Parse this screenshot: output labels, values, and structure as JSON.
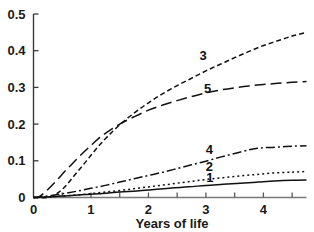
{
  "chart_data": {
    "type": "line",
    "title": "",
    "xlabel": "Years of life",
    "ylabel": "",
    "xlim": [
      0,
      4.75
    ],
    "ylim": [
      0,
      0.5
    ],
    "grid": false,
    "legend_position": "inline-curve-labels",
    "xticks": [
      0,
      1,
      2,
      3,
      4
    ],
    "xtick_labels": [
      "0",
      "1",
      "2",
      "3",
      "4"
    ],
    "xminor_ticks": [
      0.5,
      1.5,
      2.5,
      3.5,
      4.5
    ],
    "yticks": [
      0,
      0.1,
      0.2,
      0.3,
      0.4,
      0.5
    ],
    "ytick_labels": [
      "0",
      "0.1",
      "0.2",
      "0.3",
      "0.4",
      "0.5"
    ],
    "series": [
      {
        "name": "3",
        "label": "3",
        "style": "short-dash",
        "dasharray": "5,3",
        "label_x": 2.95,
        "label_y": 0.375,
        "x": [
          0.0,
          0.25,
          0.4,
          0.55,
          0.7,
          0.85,
          1.0,
          1.15,
          1.3,
          1.5,
          1.75,
          2.0,
          2.25,
          2.5,
          2.75,
          3.0,
          3.25,
          3.5,
          3.75,
          4.0,
          4.25,
          4.5,
          4.75
        ],
        "y": [
          0.0,
          0.0,
          0.01,
          0.03,
          0.058,
          0.086,
          0.115,
          0.143,
          0.168,
          0.198,
          0.23,
          0.258,
          0.283,
          0.305,
          0.325,
          0.345,
          0.363,
          0.381,
          0.398,
          0.414,
          0.427,
          0.44,
          0.45
        ]
      },
      {
        "name": "5",
        "label": "5",
        "style": "long-dash",
        "dasharray": "11,5",
        "label_x": 3.03,
        "label_y": 0.285,
        "x": [
          0.0,
          0.1,
          0.25,
          0.4,
          0.55,
          0.7,
          0.85,
          1.0,
          1.15,
          1.3,
          1.5,
          1.75,
          2.0,
          2.25,
          2.5,
          2.75,
          3.0,
          3.25,
          3.5,
          3.75,
          4.0,
          4.25,
          4.5,
          4.75
        ],
        "y": [
          0.0,
          0.002,
          0.022,
          0.046,
          0.072,
          0.096,
          0.12,
          0.142,
          0.163,
          0.18,
          0.2,
          0.22,
          0.238,
          0.252,
          0.264,
          0.275,
          0.285,
          0.293,
          0.299,
          0.304,
          0.308,
          0.311,
          0.314,
          0.316
        ]
      },
      {
        "name": "4",
        "label": "4",
        "style": "dash-dot",
        "dasharray": "9,3,2,3",
        "label_x": 3.06,
        "label_y": 0.118,
        "x": [
          0.0,
          0.25,
          0.5,
          0.75,
          1.0,
          1.25,
          1.5,
          1.75,
          2.0,
          2.25,
          2.5,
          2.75,
          3.0,
          3.25,
          3.5,
          3.75,
          3.9,
          4.05,
          4.3,
          4.55,
          4.75
        ],
        "y": [
          0.0,
          0.004,
          0.01,
          0.017,
          0.025,
          0.033,
          0.042,
          0.051,
          0.06,
          0.069,
          0.079,
          0.089,
          0.099,
          0.11,
          0.12,
          0.13,
          0.134,
          0.136,
          0.138,
          0.14,
          0.141
        ]
      },
      {
        "name": "2",
        "label": "2",
        "style": "dotted",
        "dasharray": "2,3",
        "label_x": 3.06,
        "label_y": 0.072,
        "x": [
          0.0,
          0.3,
          0.6,
          0.9,
          1.2,
          1.5,
          1.8,
          2.1,
          2.4,
          2.7,
          3.0,
          3.3,
          3.6,
          3.9,
          4.2,
          4.5,
          4.75
        ],
        "y": [
          0.0,
          0.002,
          0.005,
          0.009,
          0.014,
          0.019,
          0.025,
          0.031,
          0.037,
          0.043,
          0.049,
          0.054,
          0.059,
          0.063,
          0.067,
          0.069,
          0.071
        ]
      },
      {
        "name": "1",
        "label": "1",
        "style": "solid",
        "dasharray": "0",
        "label_x": 3.07,
        "label_y": 0.041,
        "x": [
          0.0,
          0.3,
          0.6,
          0.9,
          1.2,
          1.5,
          1.8,
          2.1,
          2.4,
          2.7,
          3.0,
          3.3,
          3.6,
          3.9,
          4.2,
          4.5,
          4.75
        ],
        "y": [
          0.0,
          0.002,
          0.005,
          0.008,
          0.011,
          0.015,
          0.018,
          0.022,
          0.026,
          0.029,
          0.033,
          0.036,
          0.039,
          0.042,
          0.045,
          0.047,
          0.048
        ]
      }
    ]
  }
}
